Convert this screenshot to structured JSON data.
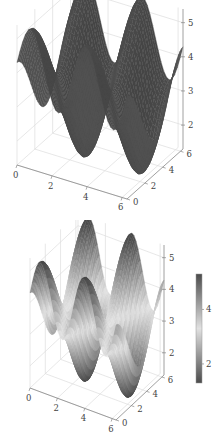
{
  "chart_data": [
    {
      "type": "surface3d",
      "title": "",
      "xlabel": "",
      "ylabel": "",
      "zlabel": "",
      "x_ticks": [
        "0",
        "2",
        "4",
        "6"
      ],
      "y_ticks": [
        "0",
        "2",
        "4",
        "6"
      ],
      "z_ticks": [
        "2",
        "3",
        "4",
        "5"
      ],
      "xlim": [
        0,
        6.28
      ],
      "ylim": [
        0,
        6.28
      ],
      "zlim": [
        1.3,
        5.4
      ],
      "surface": "z = 3.3 + 1.1*sin(2x) + 1.0*cos(y)",
      "coloring": "uniform dark gray",
      "grid": true,
      "colorbar": false
    },
    {
      "type": "surface3d",
      "title": "",
      "xlabel": "",
      "ylabel": "",
      "zlabel": "",
      "x_ticks": [
        "0",
        "2",
        "4",
        "6"
      ],
      "y_ticks": [
        "0",
        "2",
        "4",
        "6"
      ],
      "z_ticks": [
        "2",
        "3",
        "4",
        "5"
      ],
      "xlim": [
        0,
        6.28
      ],
      "ylim": [
        0,
        6.28
      ],
      "zlim": [
        1.3,
        5.4
      ],
      "surface": "z = 3.3 + 1.1*sin(2x) + 1.0*cos(y)",
      "coloring": "diverging gray colormap (dark at extremes, light in middle)",
      "grid": true,
      "colorbar": true,
      "colorbar_ticks": [
        "2",
        "4"
      ],
      "colorbar_range": [
        1.3,
        5.3
      ]
    }
  ],
  "colors": {
    "surface_dark": "#4a4a4a",
    "grid": "#dddddd",
    "axis": "#888888",
    "tick_text": "#444444"
  }
}
